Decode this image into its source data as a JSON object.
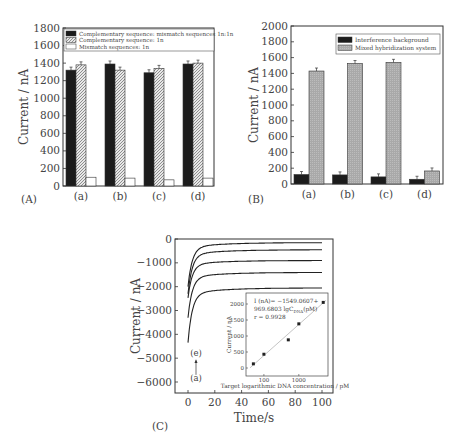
{
  "chart_data": [
    {
      "panel": "(A)",
      "type": "bar",
      "title": "",
      "xlabel": "",
      "ylabel": "Current / nA",
      "ylim": [
        0,
        1800
      ],
      "yticks": [
        0,
        200,
        400,
        600,
        800,
        1000,
        1200,
        1400,
        1600,
        1800
      ],
      "categories": [
        "(a)",
        "(b)",
        "(c)",
        "(d)"
      ],
      "legend_position": "top",
      "grid": false,
      "series": [
        {
          "name": "Complementary sequence: mismatch sequences 1n:1n",
          "style": "black",
          "values": [
            1320,
            1390,
            1290,
            1390
          ]
        },
        {
          "name": "Complementary sequence: 1n",
          "style": "hatched",
          "values": [
            1380,
            1320,
            1340,
            1400
          ]
        },
        {
          "name": "Mismatch sequences: 1n",
          "style": "white",
          "values": [
            100,
            90,
            70,
            90
          ]
        }
      ]
    },
    {
      "panel": "(B)",
      "type": "bar",
      "title": "",
      "xlabel": "",
      "ylabel": "Current / nA",
      "ylim": [
        0,
        2000
      ],
      "yticks": [
        0,
        200,
        400,
        600,
        800,
        1000,
        1200,
        1400,
        1600,
        1800,
        2000
      ],
      "categories": [
        "(a)",
        "(b)",
        "(c)",
        "(d)"
      ],
      "legend_position": "top-right",
      "grid": false,
      "series": [
        {
          "name": "Interference background",
          "style": "black",
          "values": [
            120,
            115,
            90,
            60
          ]
        },
        {
          "name": "Mixed hybridization system",
          "style": "gray",
          "values": [
            1430,
            1525,
            1540,
            165
          ]
        }
      ]
    },
    {
      "panel": "(C)",
      "type": "line",
      "title": "",
      "xlabel": "Time/s",
      "ylabel": "Current / nA",
      "xlim": [
        -5,
        105
      ],
      "ylim": [
        -6500,
        0
      ],
      "xticks": [
        0,
        20,
        40,
        60,
        80,
        100
      ],
      "yticks": [
        0,
        -1000,
        -2000,
        -3000,
        -4000,
        -5000,
        -6000
      ],
      "annotations": [
        "(e)",
        "(a)"
      ],
      "series": [
        {
          "name": "(e)",
          "start": -1800,
          "plateau": -150
        },
        {
          "name": "(d)",
          "start": -2100,
          "plateau": -450
        },
        {
          "name": "(c)",
          "start": -2300,
          "plateau": -900
        },
        {
          "name": "(b)",
          "start": -3100,
          "plateau": -1400
        },
        {
          "name": "(a)",
          "start": -4100,
          "plateau": -2050
        }
      ],
      "inset": {
        "type": "scatter",
        "xlabel": "Target logarithmic DNA concentration / pM",
        "ylabel": "Current / nA",
        "xscale": "log",
        "xticks": [
          "100",
          "1000"
        ],
        "yticks": [
          0,
          500,
          1000,
          1500,
          2000
        ],
        "x": [
          50,
          100,
          500,
          1000,
          5000
        ],
        "y": [
          130,
          430,
          880,
          1380,
          2050
        ],
        "fit_equation": "I (nA) = -1549.0607 + 969.6803 lgC_DNA (pM)",
        "equation_lines": [
          "I (nA)= −1549.0607+",
          "969.6803 lgC",
          "DNA",
          "(pM)",
          "r = 0.9928"
        ]
      }
    }
  ],
  "labels": {
    "panelA": "(A)",
    "panelB": "(B)",
    "panelC": "(C)"
  }
}
